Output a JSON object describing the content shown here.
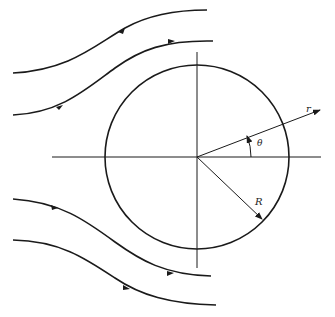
{
  "diagram": {
    "labels": {
      "r": "r",
      "theta": "θ",
      "R": "R"
    },
    "colors": {
      "stroke": "#1a1a1a",
      "background": "#ffffff"
    },
    "streamlines": 4
  }
}
